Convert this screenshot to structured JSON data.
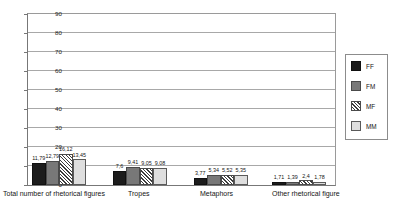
{
  "chart_data": {
    "type": "bar",
    "title": "",
    "subtitle": "",
    "xlabel": "",
    "ylabel": "",
    "ylim": [
      0,
      90
    ],
    "ytick_step": 10,
    "yticks": [
      0,
      10,
      20,
      30,
      40,
      50,
      60,
      70,
      80,
      90
    ],
    "grid": true,
    "grid_axis": "y",
    "legend_position": "right",
    "categories": [
      "Total number of rhetorical figures",
      "Tropes",
      "Metaphors",
      "Other rhetorical figure"
    ],
    "series": [
      {
        "name": "FF",
        "color": "#1c1c1c",
        "pattern": "solid",
        "values": [
          11.79,
          7.6,
          3.77,
          1.71
        ]
      },
      {
        "name": "FM",
        "color": "#787878",
        "pattern": "solid",
        "values": [
          12.79,
          9.41,
          5.34,
          1.39
        ]
      },
      {
        "name": "MF",
        "color": "#ffffff",
        "pattern": "diagonal",
        "values": [
          16.12,
          9.05,
          5.52,
          2.4
        ]
      },
      {
        "name": "MM",
        "color": "#dedede",
        "pattern": "solid",
        "values": [
          13.45,
          9.08,
          5.35,
          1.78
        ]
      }
    ],
    "data_labels": [
      [
        "11,79",
        "12,79",
        "16,12",
        "13,45"
      ],
      [
        "7,6",
        "9,41",
        "9,05",
        "9,08"
      ],
      [
        "3,77",
        "5,34",
        "5,52",
        "5,35"
      ],
      [
        "1,71",
        "1,39",
        "2,4",
        "1,78"
      ]
    ]
  },
  "axis": {
    "ytick_labels": [
      "90",
      "80",
      "70",
      "60",
      "50",
      "40",
      "30",
      "20",
      "10",
      "0"
    ]
  },
  "legend": {
    "items": [
      {
        "label": "FF"
      },
      {
        "label": "FM"
      },
      {
        "label": "MF"
      },
      {
        "label": "MM"
      }
    ]
  }
}
